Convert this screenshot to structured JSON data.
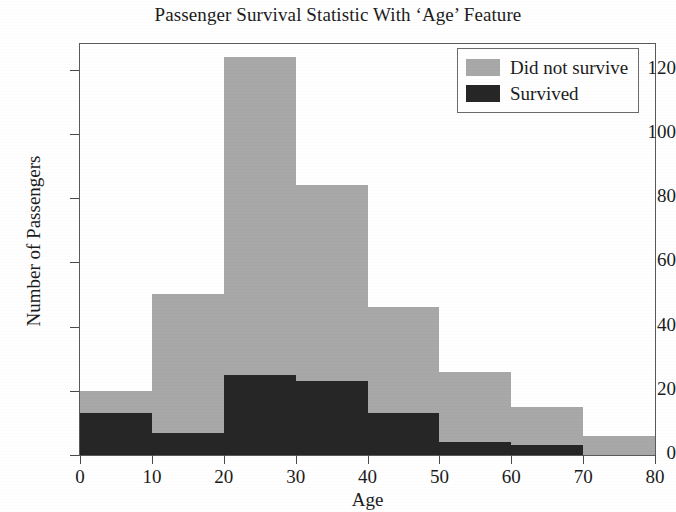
{
  "chart_data": {
    "type": "bar",
    "title": "Passenger Survival Statistic With ‘Age’ Feature",
    "xlabel": "Age",
    "ylabel": "Number of Passengers",
    "stacked": true,
    "grid": false,
    "legend_position": "top-right",
    "xlim": [
      0,
      80
    ],
    "ylim": [
      0,
      128
    ],
    "bin_width": 10,
    "xticks": [
      "0",
      "10",
      "20",
      "30",
      "40",
      "50",
      "60",
      "70",
      "80"
    ],
    "yticks": [
      "0",
      "20",
      "40",
      "60",
      "80",
      "100",
      "120"
    ],
    "categories": [
      "0-10",
      "10-20",
      "20-30",
      "30-40",
      "40-50",
      "50-60",
      "60-70",
      "70-80"
    ],
    "bin_starts": [
      0,
      10,
      20,
      30,
      40,
      50,
      60,
      70
    ],
    "series": [
      {
        "name": "Survived",
        "color": "#262626",
        "values": [
          13,
          7,
          25,
          23,
          13,
          4,
          3,
          0
        ]
      },
      {
        "name": "Did not survive",
        "color": "#a8a8a8",
        "values": [
          7,
          43,
          99,
          61,
          33,
          22,
          12,
          6
        ]
      }
    ],
    "totals": [
      20,
      50,
      124,
      84,
      46,
      26,
      15,
      6
    ]
  },
  "legend": {
    "items": [
      {
        "label": "Did not survive",
        "color": "#a8a8a8"
      },
      {
        "label": "Survived",
        "color": "#262626"
      }
    ]
  }
}
